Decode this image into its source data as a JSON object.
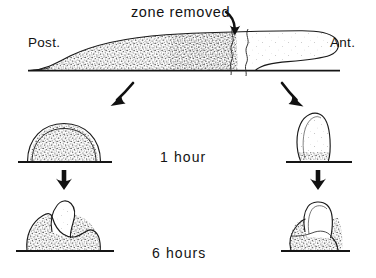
{
  "figure": {
    "title_annotation": "zone removed",
    "orientation_labels": {
      "posterior": "Post.",
      "anterior": "Ant."
    },
    "time_labels": {
      "row1": "1 hour",
      "row2": "6 hours"
    },
    "colors": {
      "ink": "#131313",
      "outline": "#1a1a1a",
      "stipple": "#3a3a3a",
      "background": "#ffffff"
    },
    "panels": [
      {
        "id": "intact-slug",
        "row": "top",
        "caption": "",
        "description": "elongated migrating slug, posterior stippled wedge, anterior clear tip, excised zone marked by two wavy vertical cut lines"
      },
      {
        "id": "posterior-fragment-1h",
        "row": "1 hour",
        "side": "left",
        "description": "rounded dome of stippled posterior tissue on substrate"
      },
      {
        "id": "anterior-fragment-1h",
        "row": "1 hour",
        "side": "right",
        "description": "upright elongate clear anterior lobe with small stippled base"
      },
      {
        "id": "posterior-fragment-6h",
        "row": "6 hours",
        "side": "left",
        "description": "stippled mass with pale regenerated tip protruding upward"
      },
      {
        "id": "anterior-fragment-6h",
        "row": "6 hours",
        "side": "right",
        "description": "stippled base with pale tongue-shaped anterior lobe"
      }
    ],
    "arrows": [
      {
        "id": "zone-removed-pointer",
        "direction": "down"
      },
      {
        "id": "branch-left",
        "direction": "down-left"
      },
      {
        "id": "branch-right",
        "direction": "down-right"
      },
      {
        "id": "time-left",
        "direction": "down"
      },
      {
        "id": "time-right",
        "direction": "down"
      }
    ]
  }
}
